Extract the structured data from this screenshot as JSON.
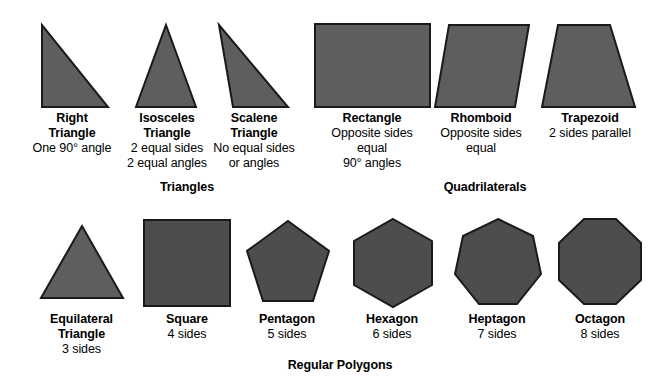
{
  "page": {
    "background_color": "#ffffff",
    "shape_fill_color": "#5e5e5e",
    "shape_stroke_color": "#1a1a1a",
    "text_color": "#000000"
  },
  "sections": [
    {
      "id": "triangles",
      "label": "Triangles",
      "shapes": [
        {
          "id": "right-triangle",
          "name_line1": "Right",
          "name_line2": "Triangle",
          "desc_line1": "One 90° angle",
          "desc_line2": "",
          "desc_line3": ""
        },
        {
          "id": "isosceles-triangle",
          "name_line1": "Isosceles",
          "name_line2": "Triangle",
          "desc_line1": "2 equal sides",
          "desc_line2": "2 equal angles",
          "desc_line3": ""
        },
        {
          "id": "scalene-triangle",
          "name_line1": "Scalene",
          "name_line2": "Triangle",
          "desc_line1": "No equal sides",
          "desc_line2": "or angles",
          "desc_line3": ""
        }
      ]
    },
    {
      "id": "quadrilaterals",
      "label": "Quadrilaterals",
      "shapes": [
        {
          "id": "rectangle",
          "name_line1": "Rectangle",
          "name_line2": "",
          "desc_line1": "Opposite sides",
          "desc_line2": "equal",
          "desc_line3": "90° angles"
        },
        {
          "id": "rhomboid",
          "name_line1": "Rhomboid",
          "name_line2": "",
          "desc_line1": "Opposite sides",
          "desc_line2": "equal",
          "desc_line3": ""
        },
        {
          "id": "trapezoid",
          "name_line1": "Trapezoid",
          "name_line2": "",
          "desc_line1": "2 sides parallel",
          "desc_line2": "",
          "desc_line3": ""
        }
      ]
    },
    {
      "id": "regular-polygons",
      "label": "Regular Polygons",
      "shapes": [
        {
          "id": "equilateral-triangle",
          "name_line1": "Equilateral",
          "name_line2": "Triangle",
          "desc_line1": "3 sides",
          "desc_line2": "",
          "desc_line3": ""
        },
        {
          "id": "square",
          "name_line1": "Square",
          "name_line2": "",
          "desc_line1": "4 sides",
          "desc_line2": "",
          "desc_line3": ""
        },
        {
          "id": "pentagon",
          "name_line1": "Pentagon",
          "name_line2": "",
          "desc_line1": "5 sides",
          "desc_line2": "",
          "desc_line3": ""
        },
        {
          "id": "hexagon",
          "name_line1": "Hexagon",
          "name_line2": "",
          "desc_line1": "6 sides",
          "desc_line2": "",
          "desc_line3": ""
        },
        {
          "id": "heptagon",
          "name_line1": "Heptagon",
          "name_line2": "",
          "desc_line1": "7 sides",
          "desc_line2": "",
          "desc_line3": ""
        },
        {
          "id": "octagon",
          "name_line1": "Octagon",
          "name_line2": "",
          "desc_line1": "8 sides",
          "desc_line2": "",
          "desc_line3": ""
        }
      ]
    }
  ]
}
